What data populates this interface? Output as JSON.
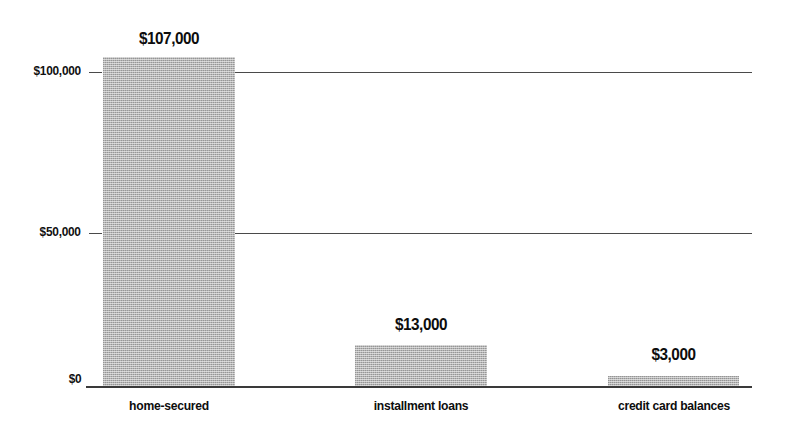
{
  "chart_data": {
    "type": "bar",
    "title": "",
    "subtitle": "",
    "xlabel": "",
    "ylabel": "",
    "categories": [
      "home-secured",
      "installment loans",
      "credit card balances"
    ],
    "values": [
      107000,
      13000,
      3000
    ],
    "value_labels": [
      "$107,000",
      "$13,000",
      "$3,000"
    ],
    "ylim": [
      0,
      120000
    ],
    "ytick_values": [
      0,
      50000,
      100000
    ],
    "ytick_labels": [
      "$0",
      "$50,000",
      "$100,000"
    ],
    "grid": "horizontal",
    "legend": "none",
    "series": [
      {
        "name": "debt balance",
        "values": [
          107000,
          13000,
          3000
        ]
      }
    ],
    "colors": {
      "bar_fill": "#b4b4b4",
      "axis": "#3a3a3a",
      "grid": "#4a4a4a",
      "text": "#0d0d0d",
      "background": "#ffffff"
    }
  },
  "axis": {
    "y": {
      "ticks": [
        {
          "label": "$100,000",
          "value": 100000
        },
        {
          "label": "$50,000",
          "value": 50000
        },
        {
          "label": "$0",
          "value": 0
        }
      ]
    }
  }
}
